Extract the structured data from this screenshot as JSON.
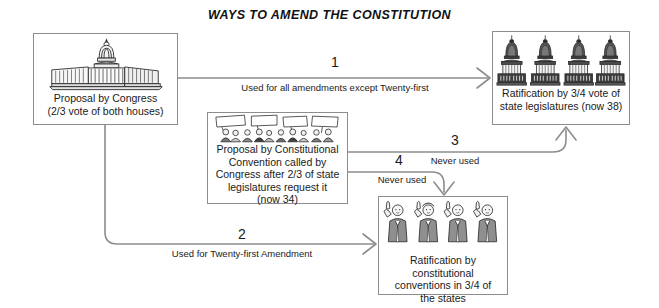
{
  "title": "WAYS TO AMEND THE CONSTITUTION",
  "colors": {
    "line": "#8d8d8d",
    "box_border": "#8d8d8d",
    "text": "#1a1a1a",
    "background": "#ffffff",
    "ink": "#2b2b2b"
  },
  "nodes": {
    "congress": {
      "icon": "capitol-building-icon",
      "line1": "Proposal by Congress",
      "line2": "(2/3 vote of both houses)"
    },
    "legislatures": {
      "icon": "four-state-capitols-icon",
      "line1": "Ratification by 3/4 vote of",
      "line2": "state legislatures (now 38)"
    },
    "convention": {
      "icon": "protesters-with-signs-icon",
      "line1": "Proposal by Constitutional",
      "line2": "Convention called by",
      "line3": "Congress after 2/3 of state",
      "line4": "legislatures request it",
      "line5": "(now 34)"
    },
    "conventions": {
      "icon": "delegates-raised-hands-icon",
      "line1": "Ratification by constitutional",
      "line2": "conventions in 3/4 of",
      "line3": "the states"
    }
  },
  "connectors": [
    {
      "id": "path-1",
      "number": "1",
      "note": "Used for all amendments except Twenty-first",
      "from": "congress",
      "to": "legislatures"
    },
    {
      "id": "path-2",
      "number": "2",
      "note": "Used for Twenty-first Amendment",
      "from": "congress",
      "to": "conventions"
    },
    {
      "id": "path-3",
      "number": "3",
      "note": "Never used",
      "from": "convention",
      "to": "legislatures"
    },
    {
      "id": "path-4",
      "number": "4",
      "note": "Never used",
      "from": "convention",
      "to": "conventions"
    }
  ]
}
